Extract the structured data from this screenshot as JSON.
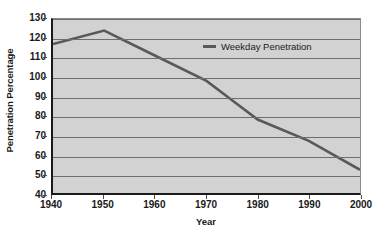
{
  "chart_data": {
    "type": "line",
    "title": "",
    "xlabel": "Year",
    "ylabel": "Penetration Percentage",
    "xlim": [
      1940,
      2000
    ],
    "ylim": [
      40,
      130
    ],
    "xticks": [
      1940,
      1950,
      1960,
      1970,
      1980,
      1990,
      2000
    ],
    "yticks": [
      40,
      50,
      60,
      70,
      80,
      90,
      100,
      110,
      120,
      130
    ],
    "grid": "horizontal",
    "legend_position": "upper-right-inside",
    "series": [
      {
        "name": "Weekday Penetration",
        "color": "#595959",
        "x": [
          1940,
          1950,
          1960,
          1970,
          1975,
          1980,
          1990,
          2000
        ],
        "values": [
          117,
          124,
          111,
          98,
          88,
          78,
          67,
          52
        ]
      }
    ],
    "plot_background": "#d2d2d2",
    "gridline_color": "#6e6e6e",
    "axis_color": "#1a1a1a"
  },
  "legend": {
    "entries": [
      {
        "label": "Weekday Penetration",
        "marker": "line-marker"
      }
    ]
  },
  "axes": {
    "y_title": "Penetration Percentage",
    "x_title": "Year",
    "y_tick_labels": [
      "130",
      "120",
      "110",
      "100",
      "90",
      "80",
      "70",
      "60",
      "50",
      "40"
    ],
    "x_tick_labels": [
      "1940",
      "1950",
      "1960",
      "1970",
      "1980",
      "1990",
      "2000"
    ]
  }
}
